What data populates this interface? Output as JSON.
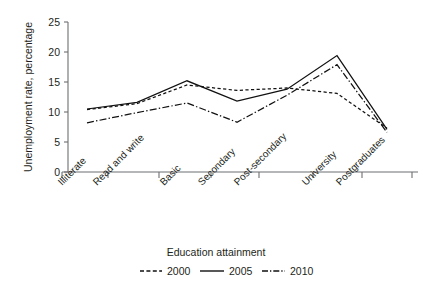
{
  "chart_data": {
    "type": "line",
    "title": "",
    "xlabel": "Education attainment",
    "ylabel": "Unemployment rate, percentage",
    "categories": [
      "Illiterate",
      "Read and write",
      "Basic",
      "Secondary",
      "Post-secondary",
      "University",
      "Postgraduates"
    ],
    "ylim": [
      0,
      25
    ],
    "yticks": [
      0,
      5,
      10,
      15,
      20,
      25
    ],
    "ytick_labels": [
      "0",
      "5",
      "10",
      "15",
      "20",
      "25"
    ],
    "grid": false,
    "legend_position": "bottom",
    "series": [
      {
        "name": "2000",
        "style": "dashed",
        "values": [
          10.4,
          11.4,
          14.5,
          13.6,
          14.0,
          13.1,
          7.3
        ]
      },
      {
        "name": "2005",
        "style": "solid",
        "values": [
          10.5,
          11.6,
          15.2,
          11.8,
          13.8,
          19.4,
          7.1
        ]
      },
      {
        "name": "2010",
        "style": "dashdot",
        "values": [
          8.2,
          9.9,
          11.5,
          8.3,
          12.8,
          17.9,
          6.6
        ]
      }
    ]
  },
  "axes": {
    "y_title": "Unemployment rate, percentage",
    "x_title": "Education attainment",
    "y_tick_0": "0",
    "y_tick_1": "5",
    "y_tick_2": "10",
    "y_tick_3": "15",
    "y_tick_4": "20",
    "y_tick_5": "25",
    "cat_0": "Illiterate",
    "cat_1": "Read and write",
    "cat_2": "Basic",
    "cat_3": "Secondary",
    "cat_4": "Post-secondary",
    "cat_5": "University",
    "cat_6": "Postgraduates"
  },
  "legend": {
    "items": [
      {
        "label": "2000"
      },
      {
        "label": "2005"
      },
      {
        "label": "2010"
      }
    ],
    "label_0": "2000",
    "label_1": "2005",
    "label_2": "2010"
  },
  "colors": {
    "line": "#111111",
    "axis": "#6d6e71",
    "text": "#231f20",
    "background": "#ffffff"
  }
}
